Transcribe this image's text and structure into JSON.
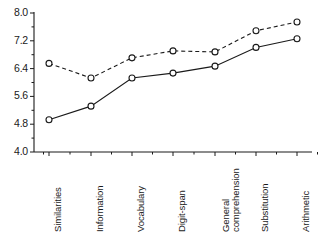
{
  "chart_data": {
    "type": "line",
    "title": "",
    "xlabel": "",
    "ylabel": "",
    "ylim": [
      4.0,
      8.0
    ],
    "ytick_values": [
      4.0,
      5.6,
      4.8,
      6.4,
      7.2,
      8.0
    ],
    "ytick_labels": [
      "8.0",
      "7.2",
      "6.4",
      "5.6",
      "4.8",
      "4.0"
    ],
    "grid": false,
    "legend": "none",
    "minor_ticks": true,
    "categories": [
      "Similarities",
      "Information",
      "Vocabulary",
      "Digit-span",
      "General comprehension",
      "Substitution",
      "Arithmetic"
    ],
    "series": [
      {
        "name": "dashed-series",
        "style": "dashed",
        "marker": "open-circle",
        "values": [
          6.55,
          6.13,
          6.71,
          6.91,
          6.88,
          7.49,
          7.74
        ]
      },
      {
        "name": "solid-series",
        "style": "solid",
        "marker": "open-circle",
        "values": [
          4.93,
          5.32,
          6.13,
          6.27,
          6.47,
          7.01,
          7.26
        ]
      }
    ],
    "colors": {
      "axis": "#1a1a1a",
      "dashed_series": "#1a1a1a",
      "solid_series": "#1a1a1a",
      "background": "#ffffff"
    }
  }
}
